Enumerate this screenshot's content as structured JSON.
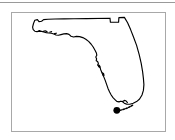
{
  "figure": {
    "title": "",
    "caption": "",
    "frame_border_color": "#a8a8a8",
    "background_color": "#ffffff",
    "top_rule_color": "#9a9a9a"
  },
  "map": {
    "subject": "Florida",
    "region_type": "us-state-outline",
    "outline_color": "#000000",
    "outline_width_px": 1.15,
    "fill": "none",
    "labels": [],
    "markers": [
      {
        "name": "location-marker",
        "shape": "filled-circle",
        "color": "#000000",
        "x_pct": 68.5,
        "y_pct": 82.5,
        "radius_px": 3.4,
        "label": ""
      }
    ],
    "features": [
      {
        "name": "panhandle",
        "label": ""
      },
      {
        "name": "big-bend",
        "label": ""
      },
      {
        "name": "gulf-coast",
        "label": ""
      },
      {
        "name": "tampa-bay-indentation",
        "label": ""
      },
      {
        "name": "charlotte-harbor-indentation",
        "label": ""
      },
      {
        "name": "atlantic-coast",
        "label": ""
      },
      {
        "name": "southern-tip",
        "label": ""
      },
      {
        "name": "florida-keys",
        "label": ""
      }
    ]
  },
  "chart_data": {
    "type": "map",
    "title": "",
    "xlabel": "",
    "ylabel": "",
    "legend": [],
    "annotations": []
  }
}
